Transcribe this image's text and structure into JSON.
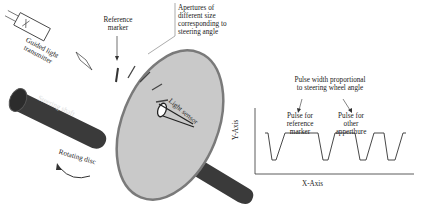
{
  "diagram": {
    "labels": {
      "transmitter": [
        "Guided light",
        "transmitter"
      ],
      "reference_marker": [
        "Reference",
        "marker"
      ],
      "apertures": [
        "Apertures of",
        "different size",
        "corresponding to",
        "steering angle"
      ],
      "steering_shaft": "Steering shaft",
      "rotating_disc": "Rotating disc",
      "light_sensor": "Light sensor"
    },
    "waveform": {
      "title": [
        "Pulse width proportional",
        "to steering wheel angle"
      ],
      "pulse_reference": [
        "Pulse for",
        "reference",
        "marker"
      ],
      "pulse_other": [
        "Pulse for",
        "other",
        "apperthure"
      ],
      "y_axis": "Y-Axis",
      "x_axis": "X-Axis"
    },
    "colors": {
      "disc": "#c9c9c9",
      "disc_edge": "#7a7a7a",
      "shaft": "#3a3a3a",
      "line": "#333333"
    }
  }
}
